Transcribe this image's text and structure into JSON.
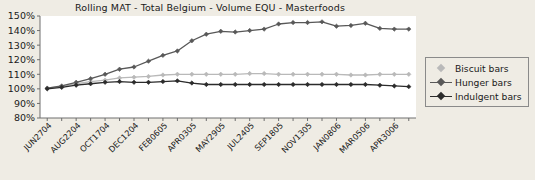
{
  "chart_data": {
    "type": "line",
    "title": "Rolling MAT - Total Belgium - Volume EQU - Masterfoods",
    "xlabel": "",
    "ylabel": "",
    "ylim": [
      80,
      150
    ],
    "ytick_labels": [
      "150%",
      "140%",
      "130%",
      "120%",
      "110%",
      "100%",
      "90%",
      "80%"
    ],
    "ytick_values": [
      150,
      140,
      130,
      120,
      110,
      100,
      90,
      80
    ],
    "grid": false,
    "legend_position": "right",
    "x": [
      "JUN2704",
      "",
      "AUG2204",
      "",
      "OCT1704",
      "",
      "DEC1204",
      "",
      "FEB0605",
      "",
      "APR0305",
      "",
      "MAY2905",
      "",
      "JUL2405",
      "",
      "SEP1805",
      "",
      "NOV1305",
      "",
      "JAN0806",
      "",
      "MAR0506",
      "",
      "APR3006",
      ""
    ],
    "tick_labels": [
      "JUN2704",
      "AUG2204",
      "OCT1704",
      "DEC1204",
      "FEB0605",
      "APR0305",
      "MAY2905",
      "JUL2405",
      "SEP1805",
      "NOV1305",
      "JAN0806",
      "MAR0506",
      "APR3006"
    ],
    "series": [
      {
        "name": "Biscuit bars",
        "color": "#b9b9b9",
        "values": [
          100.5,
          101.5,
          103.5,
          105.0,
          106.0,
          107.5,
          108.0,
          108.5,
          109.5,
          110.0,
          110.0,
          110.0,
          110.0,
          110.0,
          110.5,
          110.5,
          110.0,
          110.0,
          110.0,
          110.0,
          110.0,
          109.5,
          109.5,
          110.0,
          110.0,
          110.0
        ]
      },
      {
        "name": "Hunger bars",
        "color": "#585858",
        "values": [
          100.5,
          102.0,
          104.5,
          107.0,
          110.0,
          113.5,
          115.0,
          119.0,
          123.0,
          126.0,
          133.0,
          137.5,
          139.5,
          139.0,
          140.0,
          141.0,
          144.5,
          145.5,
          145.5,
          146.0,
          143.0,
          143.5,
          145.0,
          141.5,
          141.0,
          141.0
        ]
      },
      {
        "name": "Indulgent bars",
        "color": "#2b2b2b",
        "values": [
          100.0,
          101.0,
          102.5,
          103.5,
          104.5,
          105.0,
          104.5,
          104.5,
          105.0,
          105.5,
          104.0,
          103.0,
          103.0,
          103.0,
          103.0,
          103.0,
          103.0,
          103.0,
          103.0,
          103.0,
          103.0,
          103.0,
          103.0,
          102.5,
          102.0,
          101.5
        ]
      }
    ]
  },
  "legend": {
    "items": [
      {
        "label": "Biscuit bars"
      },
      {
        "label": "Hunger bars"
      },
      {
        "label": "Indulgent bars"
      }
    ]
  },
  "colors": {
    "background": "#efece4",
    "plot_background": "#ffffff",
    "axis": "#6e6e6e",
    "text": "#1a1a1a"
  }
}
